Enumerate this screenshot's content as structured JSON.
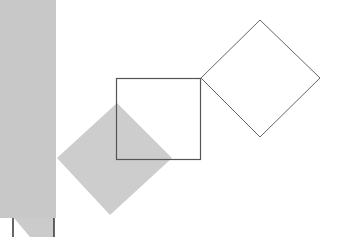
{
  "figure": {
    "description": "Geometric diagram: a square with a tilted outline square on its top-right corner and a gray filled diamond overlapping its lower-left",
    "colors": {
      "background": "#ffffff",
      "panel": "#c8c8c8",
      "fill_diamond": "#cdcdcd",
      "stroke": "#555555"
    },
    "shapes": [
      {
        "name": "left-panel",
        "type": "rect",
        "x": 0,
        "y": 0,
        "w": 56,
        "h": 218,
        "fill": "#c8c8c8"
      },
      {
        "name": "filled-diamond",
        "type": "polygon",
        "points": "117,103 172,158 110,215 57,158",
        "fill": "#cdcdcd"
      },
      {
        "name": "center-square",
        "type": "rect",
        "x": 116,
        "y": 78,
        "w": 84,
        "h": 81,
        "stroke": "#555555"
      },
      {
        "name": "rotated-square",
        "type": "polygon",
        "points": "260,20 320,78 260,137 201,78",
        "stroke": "#555555"
      }
    ],
    "bottom_marks": [
      {
        "x1": 13,
        "y1": 218,
        "x2": 13,
        "y2": 237
      },
      {
        "x1": 54,
        "y1": 218,
        "x2": 54,
        "y2": 237
      }
    ]
  }
}
